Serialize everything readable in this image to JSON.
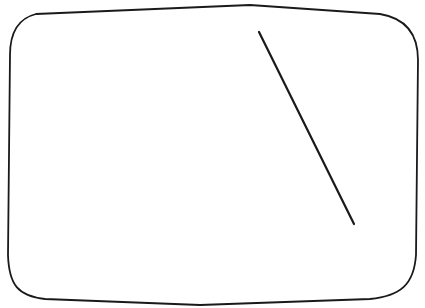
{
  "drawing": {
    "stroke_color": "#1a1a1a",
    "background": "#ffffff",
    "frame": {
      "shape": "rounded-rectangle",
      "path": "M 36 14 C 20 18 10 30 10 55 L 8 255 C 9 285 18 296 45 299 L 200 305 L 370 299 C 400 296 414 285 416 255 L 418 60 C 418 32 404 18 380 14 L 250 5 Z"
    },
    "line": {
      "x1": 259,
      "y1": 32,
      "x2": 354,
      "y2": 224
    }
  }
}
